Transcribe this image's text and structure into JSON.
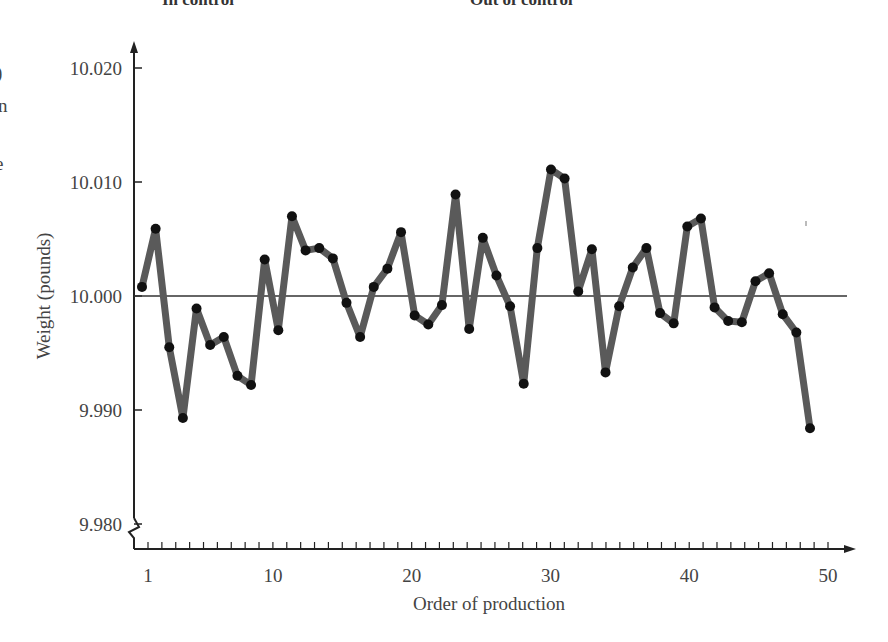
{
  "header": {
    "left_label": "In control",
    "right_label": "Out of control"
  },
  "edge_fragments": [
    ")",
    "n",
    "e"
  ],
  "chart_data": {
    "type": "line",
    "title": "",
    "xlabel": "Order of production",
    "ylabel": "Weight (pounds)",
    "x_tick_labels": [
      "1",
      "10",
      "20",
      "30",
      "40",
      "50"
    ],
    "x_tick_values": [
      1,
      10,
      20,
      30,
      40,
      50
    ],
    "y_tick_labels": [
      "10.020",
      "10.010",
      "10.000",
      "9.990",
      "9.980"
    ],
    "y_tick_values": [
      10.02,
      10.01,
      10.0,
      9.99,
      9.98
    ],
    "ylim": [
      9.98,
      10.02
    ],
    "xlim": [
      1,
      50
    ],
    "center_line": 10.0,
    "axis_break": "y-axis break (zigzag) near 9.980",
    "grid": false,
    "legend": null,
    "series": [
      {
        "name": "Weight",
        "x": [
          1,
          2,
          3,
          4,
          5,
          6,
          7,
          8,
          9,
          10,
          11,
          12,
          13,
          14,
          15,
          16,
          17,
          18,
          19,
          20,
          21,
          22,
          23,
          24,
          25,
          26,
          27,
          28,
          29,
          30,
          31,
          32,
          33,
          34,
          35,
          36,
          37,
          38,
          39,
          40,
          41,
          42,
          43,
          44,
          45,
          46,
          47,
          48,
          49,
          50
        ],
        "values": [
          10.0008,
          10.0059,
          9.9955,
          9.9893,
          9.9989,
          9.9957,
          9.9964,
          9.993,
          9.9922,
          10.0032,
          9.997,
          10.007,
          10.004,
          10.0042,
          10.0033,
          9.9994,
          9.9964,
          10.0008,
          10.0024,
          10.0056,
          9.9983,
          9.9975,
          9.9992,
          10.0089,
          9.9971,
          10.0051,
          10.0018,
          9.9991,
          9.9923,
          10.0042,
          10.0111,
          10.0103,
          10.0004,
          10.0041,
          9.9933,
          9.9991,
          10.0025,
          10.0042,
          9.9985,
          9.9976,
          10.0061,
          10.0068,
          9.999,
          9.9978,
          9.9977,
          10.0013,
          10.002,
          9.9984,
          9.9968,
          9.9884
        ]
      }
    ]
  },
  "style": {
    "line_color": "#5a5a5a",
    "marker_color": "#111111",
    "axis_color": "#222222",
    "center_line_color": "#333333"
  }
}
